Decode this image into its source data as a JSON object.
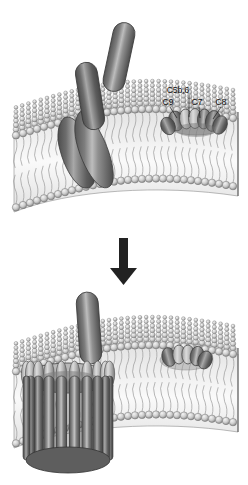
{
  "figure": {
    "background_color": "#ffffff",
    "ink_color": "#111111",
    "panels": [
      {
        "id": "upper",
        "name": "assembly-stage",
        "description": "Lipid bilayer with C5b,6 / C7 / C8 complex inserted and free C9 molecules approaching"
      },
      {
        "id": "lower",
        "name": "pore-stage",
        "description": "Lipid bilayer with completed poly-C9 membrane attack complex pore"
      }
    ],
    "labels": [
      {
        "id": "c5b6",
        "text": "C5b,6",
        "x": 178,
        "y": 93,
        "leader_to_x": 189,
        "leader_to_y": 117
      },
      {
        "id": "c9",
        "text": "C9",
        "x": 168,
        "y": 104,
        "leader_to_x": 178,
        "leader_to_y": 119
      },
      {
        "id": "c7",
        "text": "C7",
        "x": 196,
        "y": 104,
        "leader_to_x": 199,
        "leader_to_y": 119
      },
      {
        "id": "c8",
        "text": "C8",
        "x": 219,
        "y": 104,
        "leader_to_x": 212,
        "leader_to_y": 120
      }
    ],
    "arrow": {
      "name": "transition-arrow",
      "direction": "down",
      "color": "#222222",
      "x": 124,
      "y_top": 238,
      "y_bottom": 283
    },
    "colors": {
      "capsule_dark": "#5a5a5a",
      "capsule_mid": "#8e8e8e",
      "capsule_light": "#d2d2d2",
      "lipid_head": "#cfcfcf",
      "lipid_head_edge": "#6f6f6f",
      "membrane_core": "#f2f2f2",
      "membrane_edge": "#9a9a9a",
      "outline": "#3a3a3a"
    },
    "counts": {
      "free_c9_upper": 2,
      "membrane_inserted_upper": 1,
      "pore_staves_lower": 10,
      "standing_c9_lower": 1
    }
  }
}
